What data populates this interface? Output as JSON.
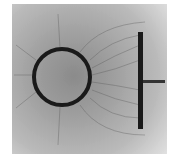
{
  "image": {
    "description": "Photograph of electric field line pattern (grass seeds in oil) between a charged ring and a charged plate",
    "colors": {
      "background": "#ffffff",
      "field": "#9a9a9a",
      "electrode": "#1a1a1a"
    }
  }
}
